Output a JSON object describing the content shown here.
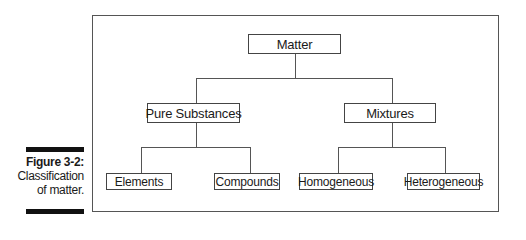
{
  "caption": {
    "label": "Figure 3-2:",
    "lines": [
      "Classification",
      "of matter."
    ]
  },
  "diagram": {
    "root": {
      "label": "Matter"
    },
    "level2": [
      {
        "label": "Pure Substances"
      },
      {
        "label": "Mixtures"
      }
    ],
    "level3": [
      {
        "label": "Elements",
        "parent": "Pure Substances"
      },
      {
        "label": "Compounds",
        "parent": "Pure Substances"
      },
      {
        "label": "Homogeneous",
        "parent": "Mixtures"
      },
      {
        "label": "Heterogeneous",
        "parent": "Mixtures"
      }
    ]
  }
}
